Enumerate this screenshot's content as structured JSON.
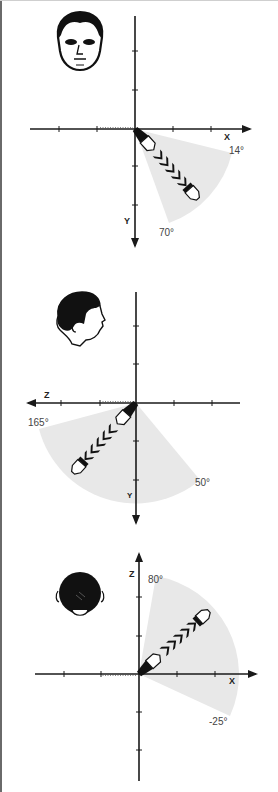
{
  "figure": {
    "panels": [
      {
        "view": "front",
        "head_icon": "face-front-icon",
        "horizontal_axis": {
          "label": "X",
          "direction": "right"
        },
        "vertical_axis": {
          "label": "Y",
          "direction": "down"
        },
        "range": {
          "start_label": "14°",
          "end_label": "70°",
          "start_deg": 14,
          "end_deg": 70
        }
      },
      {
        "view": "side",
        "head_icon": "face-profile-icon",
        "horizontal_axis": {
          "label": "Z",
          "direction": "left"
        },
        "vertical_axis": {
          "label": "Y",
          "direction": "down"
        },
        "range": {
          "start_label": "165°",
          "end_label": "50°",
          "start_deg": 165,
          "end_deg": 50
        }
      },
      {
        "view": "top",
        "head_icon": "head-top-icon",
        "horizontal_axis": {
          "label": "X",
          "direction": "right"
        },
        "vertical_axis": {
          "label": "Z",
          "direction": "up"
        },
        "range": {
          "start_label": "80°",
          "end_label": "-25°",
          "start_deg": 80,
          "end_deg": -25
        }
      }
    ]
  },
  "colors": {
    "axis": "#1a1a1a",
    "wedge": "#e8e8e8",
    "pencil_dark": "#111111",
    "pencil_light": "#ffffff",
    "label": "#444444"
  }
}
